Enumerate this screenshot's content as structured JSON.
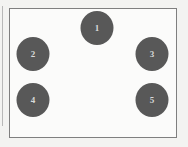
{
  "diagram": {
    "type": "node-layout",
    "frame": {
      "border_color": "#7f7f7f",
      "background": "#fbfbfa"
    },
    "node_color": "#585858",
    "nodes": [
      {
        "id": 1,
        "label": "1",
        "x": 97,
        "y": 28
      },
      {
        "id": 2,
        "label": "2",
        "x": 33,
        "y": 54
      },
      {
        "id": 3,
        "label": "3",
        "x": 152,
        "y": 54
      },
      {
        "id": 4,
        "label": "4",
        "x": 33,
        "y": 100
      },
      {
        "id": 5,
        "label": "5",
        "x": 152,
        "y": 100
      }
    ]
  }
}
